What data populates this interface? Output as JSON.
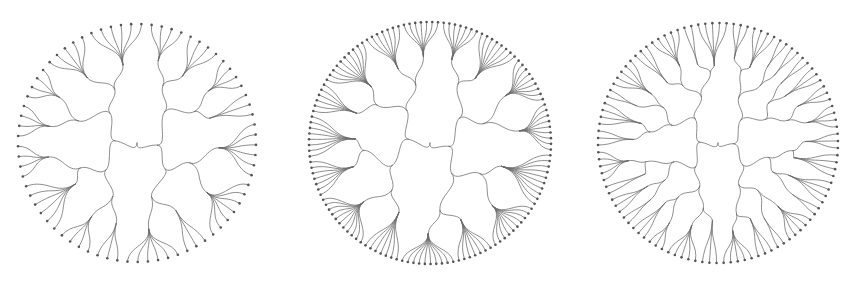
{
  "figure": {
    "width": 850,
    "height": 286,
    "background": "#ffffff",
    "link_color": "#6a6a6a",
    "leaf_color": "#555555",
    "layout": "radial-tree",
    "link_style": "radial-diagonal-curve"
  },
  "trees": [
    {
      "id": "tree-1",
      "cx": 137,
      "cy": 143,
      "radius": 119,
      "branching": [
        2,
        2,
        2,
        2
      ],
      "leaf_fan": [
        3,
        7
      ],
      "seed": 11,
      "leaf_count_estimate": 170
    },
    {
      "id": "tree-2",
      "cx": 430,
      "cy": 143,
      "radius": 121,
      "branching": [
        2,
        2,
        2,
        2
      ],
      "leaf_fan": [
        6,
        11
      ],
      "seed": 23,
      "leaf_count_estimate": 210
    },
    {
      "id": "tree-3",
      "cx": 718,
      "cy": 143,
      "radius": 120,
      "branching": [
        2,
        2,
        2,
        2,
        2
      ],
      "leaf_fan": [
        2,
        5
      ],
      "seed": 37,
      "leaf_count_estimate": 190
    }
  ]
}
